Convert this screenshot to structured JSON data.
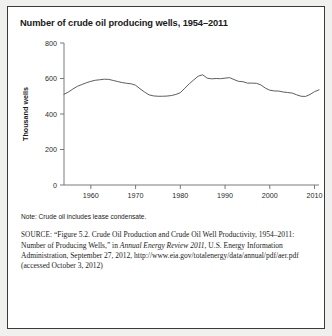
{
  "chart_title": "Number of crude oil producing wells, 1954–2011",
  "note": "Note: Crude oil includes lease condensate.",
  "source": {
    "label": "SOURCE:",
    "text_before_italic": " “Figure 5.2. Crude Oil Production and Crude Oil Well Productivity, 1954–2011: Number of Producing Wells,” in ",
    "italic_title": "Annual Energy Review 2011",
    "text_after_italic": ", U.S. Energy Information Administration, September 27, 2012, http://www.eia.gov/totalenergy/data/annual/pdf/aer.pdf (accessed October 3, 2012)"
  },
  "chart_data": {
    "type": "line",
    "title": "Number of crude oil producing wells, 1954–2011",
    "xlabel": "",
    "ylabel": "Thousand wells",
    "xlim": [
      1954,
      2011
    ],
    "ylim": [
      0,
      800
    ],
    "yticks": [
      0,
      200,
      400,
      600,
      800
    ],
    "xticks": [
      1960,
      1970,
      1980,
      1990,
      2000,
      2010
    ],
    "grid": false,
    "legend": null,
    "line_color": "#555555",
    "x": [
      1954,
      1955,
      1956,
      1957,
      1958,
      1959,
      1960,
      1961,
      1962,
      1963,
      1964,
      1965,
      1966,
      1967,
      1968,
      1969,
      1970,
      1971,
      1972,
      1973,
      1974,
      1975,
      1976,
      1977,
      1978,
      1979,
      1980,
      1981,
      1982,
      1983,
      1984,
      1985,
      1986,
      1987,
      1988,
      1989,
      1990,
      1991,
      1992,
      1993,
      1994,
      1995,
      1996,
      1997,
      1998,
      1999,
      2000,
      2001,
      2002,
      2003,
      2004,
      2005,
      2006,
      2007,
      2008,
      2009,
      2010,
      2011
    ],
    "values": [
      511,
      524,
      541,
      556,
      566,
      576,
      584,
      590,
      593,
      596,
      595,
      589,
      583,
      577,
      573,
      570,
      562,
      542,
      524,
      508,
      502,
      500,
      500,
      501,
      504,
      510,
      520,
      545,
      570,
      592,
      613,
      621,
      602,
      598,
      600,
      599,
      602,
      605,
      594,
      584,
      582,
      574,
      574,
      573,
      564,
      546,
      534,
      530,
      529,
      524,
      521,
      518,
      508,
      500,
      499,
      510,
      526,
      536
    ]
  }
}
